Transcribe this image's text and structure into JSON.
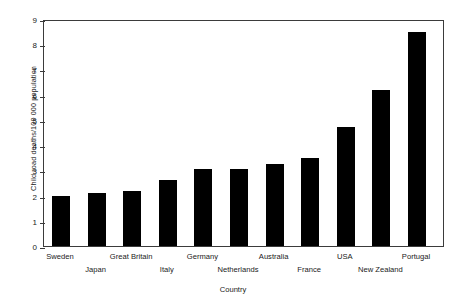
{
  "chart_data": {
    "type": "bar",
    "title": "",
    "xlabel": "Country",
    "ylabel": "Child road deaths/100 000 population",
    "categories": [
      "Sweden",
      "Japan",
      "Great Britain",
      "Italy",
      "Germany",
      "Netherlands",
      "Australia",
      "France",
      "USA",
      "New Zealand",
      "Portugal"
    ],
    "values": [
      2.0,
      2.1,
      2.2,
      2.6,
      3.05,
      3.05,
      3.25,
      3.5,
      4.7,
      6.2,
      8.5
    ],
    "ylim": [
      0,
      9
    ],
    "yticks": [
      0,
      1,
      2,
      3,
      4,
      5,
      6,
      7,
      8,
      9
    ],
    "ytick_labels": [
      "0",
      "1",
      "2",
      "3",
      "4",
      "5",
      "6",
      "7",
      "8",
      "9"
    ],
    "grid": false,
    "legend": null,
    "bar_color": "#000000",
    "axis_color": "#3b3b3b",
    "label_stagger": [
      0,
      1,
      0,
      1,
      0,
      1,
      0,
      1,
      0,
      1,
      0
    ]
  }
}
